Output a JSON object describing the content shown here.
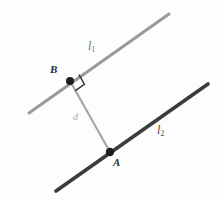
{
  "figure": {
    "background_color": "#fdfdfd",
    "width": 224,
    "height": 199,
    "lines": [
      {
        "id": "l1",
        "label": "l",
        "subscript": "1",
        "color": "#9a9a9a",
        "stroke_width": 3,
        "x1": 29,
        "y1": 113,
        "x2": 169,
        "y2": 14,
        "label_x": 88,
        "label_y": 40
      },
      {
        "id": "l2",
        "label": "l",
        "subscript": "2",
        "color": "#3c3c3c",
        "stroke_width": 3.6,
        "x1": 56,
        "y1": 191,
        "x2": 208,
        "y2": 84,
        "label_x": 157,
        "label_y": 124
      }
    ],
    "segment": {
      "id": "d",
      "label": "d",
      "color": "#a6a6a6",
      "stroke_width": 2.2,
      "x1": 70,
      "y1": 81,
      "x2": 110,
      "y2": 152,
      "label_x": 73,
      "label_y": 112
    },
    "points": [
      {
        "id": "B",
        "label": "B",
        "x": 70,
        "y": 81,
        "radius": 4,
        "color": "#1c1c1c",
        "label_x": 50,
        "label_y": 64
      },
      {
        "id": "A",
        "label": "A",
        "x": 110,
        "y": 152,
        "radius": 4.2,
        "color": "#1c1c1c",
        "label_x": 113,
        "label_y": 157
      }
    ],
    "right_angle": {
      "at_point": "B",
      "color": "#2f2f2f",
      "stroke_width": 1.4,
      "size": 11
    }
  }
}
